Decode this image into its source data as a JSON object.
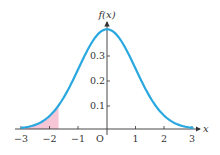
{
  "chart_data": {
    "type": "line",
    "title": "",
    "xlabel": "x",
    "ylabel": "f(x)",
    "xlim": [
      -3,
      3
    ],
    "ylim": [
      0,
      0.4
    ],
    "x_ticks": [
      -3,
      -2,
      -1,
      0,
      1,
      2,
      3
    ],
    "x_tick_labels": [
      "−3",
      "−2",
      "−1",
      "O",
      "1",
      "2",
      "3"
    ],
    "y_ticks": [
      0.1,
      0.2,
      0.3
    ],
    "y_tick_labels": [
      "0.1",
      "0.2",
      "0.3"
    ],
    "grid": false,
    "series": [
      {
        "name": "standard normal density f(x)",
        "function": "exp(-x^2/2)/sqrt(2*pi)",
        "color": "#29a8e0",
        "x": [
          -3,
          -2.5,
          -2,
          -1.5,
          -1,
          -0.5,
          0,
          0.5,
          1,
          1.5,
          2,
          2.5,
          3
        ],
        "values": [
          0.004,
          0.018,
          0.054,
          0.13,
          0.242,
          0.352,
          0.399,
          0.352,
          0.242,
          0.13,
          0.054,
          0.018,
          0.004
        ]
      }
    ],
    "shaded_region": {
      "from": -3,
      "to": -1.7,
      "color": "#f7c6d6"
    },
    "origin_label": "O"
  },
  "labels": {
    "y_axis": "f(x)",
    "x_axis": "x",
    "origin": "O",
    "x_ticks": [
      "−3",
      "−2",
      "−1",
      "1",
      "2",
      "3"
    ],
    "y_ticks": [
      "0.1",
      "0.2",
      "0.3"
    ]
  },
  "colors": {
    "curve": "#29a8e0",
    "shade": "#f7c6d6",
    "axis": "#333333"
  }
}
